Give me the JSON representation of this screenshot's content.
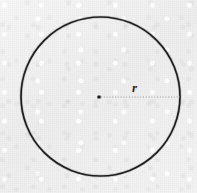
{
  "figure": {
    "kind": "geometry-diagram",
    "canvas": {
      "width": 197,
      "height": 193,
      "background_color": "#f1f1f1",
      "paper_texture": "scanned-page-grain"
    },
    "circle": {
      "center_x": 100.5,
      "center_y": 96.5,
      "radius": 79.5,
      "stroke_color": "#1d1d20",
      "stroke_width": 1.7,
      "fill": "none"
    },
    "center_point": {
      "x": 99,
      "y": 97,
      "size": 3.2,
      "color": "#1a1a1d"
    },
    "radius_line": {
      "start_x": 101,
      "start_y": 97,
      "end_x": 180,
      "end_y": 97,
      "stroke_color": "#9a9a9e",
      "stroke_width": 1,
      "dash_pattern": "1 1.8",
      "style": "dotted"
    },
    "radius_label": {
      "text": "r",
      "x": 132,
      "y": 81,
      "font_size": 13,
      "font_style": "italic",
      "color": "#26262a"
    }
  }
}
